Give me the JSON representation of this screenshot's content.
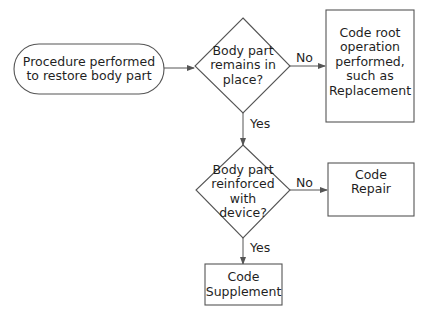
{
  "diagram": {
    "type": "flowchart",
    "nodes": {
      "start": {
        "shape": "terminal",
        "text": "Procedure performed to restore body part",
        "lines": [
          "Procedure performed",
          "to restore body part"
        ]
      },
      "decision1": {
        "shape": "diamond",
        "text": "Body part remains in place?",
        "lines": [
          "Body part",
          "remains in",
          "place?"
        ]
      },
      "outcome_root": {
        "shape": "rectangle",
        "text": "Code root operation performed, such as Replacement",
        "lines": [
          "Code root",
          "operation",
          "performed,",
          "such as",
          "Replacement"
        ]
      },
      "decision2": {
        "shape": "diamond",
        "text": "Body part reinforced with device?",
        "lines": [
          "Body part",
          "reinforced",
          "with",
          "device?"
        ]
      },
      "outcome_repair": {
        "shape": "rectangle",
        "text": "Code Repair",
        "lines": [
          "Code",
          "Repair"
        ]
      },
      "outcome_supplement": {
        "shape": "rectangle",
        "text": "Code Supplement",
        "lines": [
          "Code",
          "Supplement"
        ]
      }
    },
    "edges": [
      {
        "from": "start",
        "to": "decision1",
        "label": ""
      },
      {
        "from": "decision1",
        "to": "outcome_root",
        "label": "No"
      },
      {
        "from": "decision1",
        "to": "decision2",
        "label": "Yes"
      },
      {
        "from": "decision2",
        "to": "outcome_repair",
        "label": "No"
      },
      {
        "from": "decision2",
        "to": "outcome_supplement",
        "label": "Yes"
      }
    ],
    "colors": {
      "stroke": "#555555",
      "text": "#1f1f1f",
      "background": "#ffffff"
    }
  }
}
